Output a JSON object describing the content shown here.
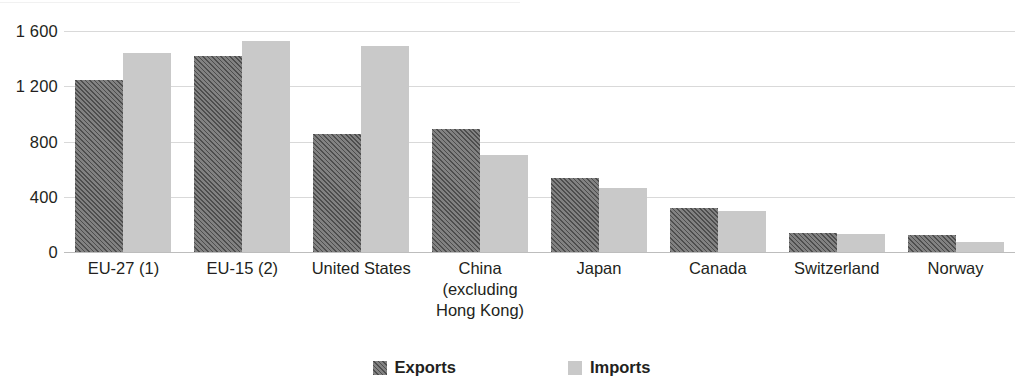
{
  "chart_data": {
    "type": "bar",
    "title": "",
    "xlabel": "",
    "ylabel": "",
    "grid": true,
    "legend_position": "bottom-center",
    "ylim": [
      0,
      1600
    ],
    "yticks": [
      0,
      400,
      800,
      1200,
      1600
    ],
    "ytick_labels": [
      "0",
      "400",
      "800",
      "1 200",
      "1 600"
    ],
    "categories": [
      "EU-27 (1)",
      "EU-15 (2)",
      "United States",
      "China (excluding Hong Kong)",
      "Japan",
      "Canada",
      "Switzerland",
      "Norway"
    ],
    "category_lines": [
      [
        "EU-27 (1)"
      ],
      [
        "EU-15 (2)"
      ],
      [
        "United States"
      ],
      [
        "China",
        "(excluding",
        "Hong Kong)"
      ],
      [
        "Japan"
      ],
      [
        "Canada"
      ],
      [
        "Switzerland"
      ],
      [
        "Norway"
      ]
    ],
    "series": [
      {
        "name": "Exports",
        "color": "#6f6f6f",
        "pattern": "diagonal-hatch",
        "values": [
          1245,
          1420,
          855,
          890,
          535,
          320,
          140,
          125
        ]
      },
      {
        "name": "Imports",
        "color": "#c9c9c9",
        "pattern": "solid",
        "values": [
          1440,
          1530,
          1490,
          705,
          460,
          295,
          132,
          70
        ]
      }
    ]
  },
  "legend": {
    "items": [
      {
        "label": "Exports",
        "swatch": "exports-swatch"
      },
      {
        "label": "Imports",
        "swatch": "imports-swatch"
      }
    ]
  },
  "colors": {
    "exports": "#6f6f6f",
    "imports": "#c9c9c9",
    "gridline": "#d9d9d9",
    "baseline": "#bdbdbd",
    "text": "#231f20",
    "background": "#ffffff"
  }
}
